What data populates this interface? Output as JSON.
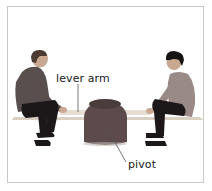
{
  "figure": {
    "labels": {
      "lever_arm": "lever arm",
      "pivot": "pivot"
    },
    "colors": {
      "border": "#c8c8c8",
      "pivot_body": "#5c4a4c",
      "plank": "#d9cfc2",
      "shirt_left": "#5a4f4f",
      "shirt_right": "#9a8a86",
      "trousers": "#1c1718",
      "skin": "#c9a892",
      "hair_left": "#4a3a30",
      "hair_right": "#151212",
      "leader_line": "#555555"
    }
  }
}
